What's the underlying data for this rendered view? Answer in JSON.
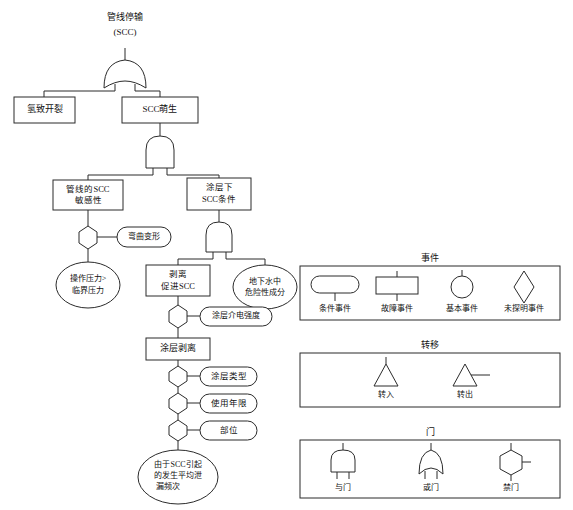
{
  "diagram": {
    "title_top": "管线停输",
    "nodes": {
      "top_event_l1": "管线停输",
      "top_event_l2": "(SCC)",
      "hydrogen_cracking": "氢致开裂",
      "scc_initiation": "SCC萌生",
      "pipeline_scc_susceptibility_l1": "管线的SCC",
      "pipeline_scc_susceptibility_l2": "敏感性",
      "under_coating_scc_cond_l1": "涂层下",
      "under_coating_scc_cond_l2": "SCC条件",
      "bending_deformation": "弯曲变形",
      "operating_pressure_l1": "操作压力>",
      "operating_pressure_l2": "临界压力",
      "disbondment_promotes_scc_l1": "剥离",
      "disbondment_promotes_scc_l2": "促进SCC",
      "groundwater_hazard_l1": "地下水中",
      "groundwater_hazard_l2": "危险性成分",
      "coating_dielectric_strength": "涂层介电强度",
      "coating_disbondment": "涂层剥离",
      "coating_type": "涂层类型",
      "service_life": "使用年限",
      "location": "部位",
      "avg_leak_freq_l1": "由于SCC引起",
      "avg_leak_freq_l2": "的发生平均泄",
      "avg_leak_freq_l3": "漏频次"
    }
  },
  "legend": {
    "events": {
      "title": "事件",
      "items": [
        {
          "label": "条件事件",
          "shape": "rounded-rect"
        },
        {
          "label": "故障事件",
          "shape": "rectangle"
        },
        {
          "label": "基本事件",
          "shape": "circle"
        },
        {
          "label": "未探明事件",
          "shape": "diamond"
        }
      ]
    },
    "transfer": {
      "title": "转移",
      "items": [
        {
          "label": "转入",
          "shape": "triangle-top-line"
        },
        {
          "label": "转出",
          "shape": "triangle-side-line"
        }
      ]
    },
    "gates": {
      "title": "门",
      "items": [
        {
          "label": "与门",
          "shape": "and-gate"
        },
        {
          "label": "或门",
          "shape": "or-gate"
        },
        {
          "label": "禁门",
          "shape": "inhibit-gate"
        }
      ]
    }
  },
  "colors": {
    "stroke": "#2b2b2b",
    "fill": "#ffffff",
    "text": "#111111"
  }
}
